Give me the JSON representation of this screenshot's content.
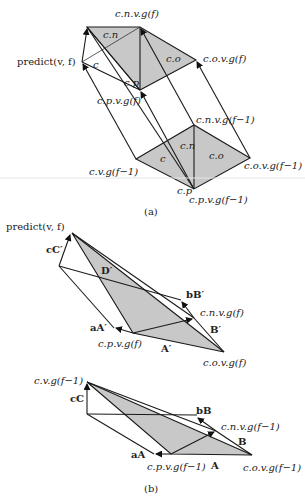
{
  "figure_a": {
    "caption": "(a)",
    "labels": {
      "predict": "predict(v, f)",
      "cnvgf": "c.n.v.g(f)",
      "covgf": "c.o.v.g(f)",
      "cpvgf": "c.p.v.g(f)",
      "cnvgf1": "c.n.v.g(f−1)",
      "covgf1": "c.o.v.g(f−1)",
      "cvgf1": "c.v.g(f−1)",
      "cpvgf1": "c.p.v.g(f−1)",
      "cn_top": "c.n",
      "c_top": "c",
      "co_top": "c.o",
      "cp_top": "c.p",
      "cn_bot": "c.n",
      "c_bot": "c",
      "co_bot": "c.o",
      "cp_bot": "c.p"
    }
  },
  "figure_b": {
    "caption": "(b)",
    "upper": {
      "predict": "predict(v, f)",
      "cC": "cC′",
      "D": "D′",
      "bB": "bB′",
      "cnvgf": "c.n.v.g(f)",
      "B": "B′",
      "aA": "aA′",
      "cpvgf": "c.p.v.g(f)",
      "A": "A′",
      "covgf": "c.o.v.g(f)"
    },
    "lower": {
      "cvgf1": "c.v.g(f−1)",
      "cC": "cC",
      "bB": "bB",
      "cnvgf1": "c.n.v.g(f−1)",
      "B": "B",
      "aA": "aA",
      "cpvgf1": "c.p.v.g(f−1)",
      "A": "A",
      "covgf1": "c.o.v.g(f−1)"
    }
  },
  "colors": {
    "shade": "#c8c8c8",
    "line": "#1a1a1a"
  }
}
